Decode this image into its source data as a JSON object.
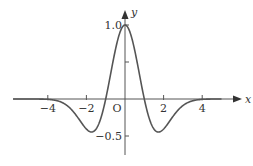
{
  "chart_data": {
    "type": "line",
    "title": "",
    "function": "y = (1 - x^2) e^{-x^2/2}",
    "xlabel": "x",
    "ylabel": "y",
    "origin_label": "O",
    "x_ticks": [
      -4,
      -2,
      2,
      4
    ],
    "x_tick_labels": [
      "−4",
      "−2",
      "2",
      "4"
    ],
    "y_ticks": [
      1.0,
      0.5,
      -0.5
    ],
    "y_tick_labels": [
      "1.0",
      "",
      "−0.5"
    ],
    "xlim": [
      -5.8,
      5.9
    ],
    "ylim": [
      -0.75,
      1.3
    ],
    "grid": false,
    "series": [
      {
        "name": "curve",
        "x": [
          -4.5,
          -4,
          -3.5,
          -3,
          -2.5,
          -2,
          -1.73,
          -1.5,
          -1,
          -0.5,
          0,
          0.5,
          1,
          1.5,
          1.73,
          2,
          2.5,
          3,
          3.5,
          4,
          4.5
        ],
        "y": [
          -0.0008,
          -0.005,
          -0.025,
          -0.089,
          -0.231,
          -0.406,
          -0.446,
          -0.405,
          0,
          0.662,
          1,
          0.662,
          0,
          -0.405,
          -0.446,
          -0.406,
          -0.231,
          -0.089,
          -0.025,
          -0.005,
          -0.0008
        ]
      }
    ],
    "color": "#444444"
  }
}
